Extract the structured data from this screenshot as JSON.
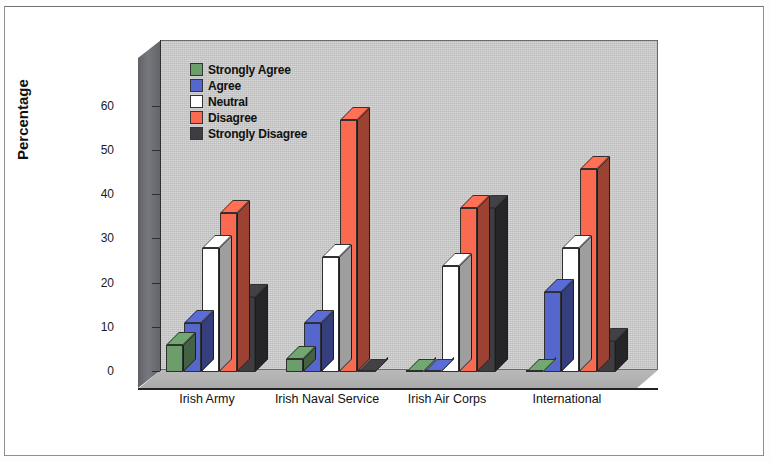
{
  "figure": {
    "axis_title": "Percentage",
    "border_color": "#8d8f92",
    "plot_bg": "#c9c9c9"
  },
  "legend": {
    "items": [
      {
        "label": "Strongly Agree",
        "color": "#6b9e6b"
      },
      {
        "label": "Agree",
        "color": "#5566cc"
      },
      {
        "label": "Neutral",
        "color": "#ffffff"
      },
      {
        "label": "Disagree",
        "color": "#fa6a50"
      },
      {
        "label": "Strongly Disagree",
        "color": "#3d3d42"
      }
    ]
  },
  "chart_data": {
    "type": "bar",
    "title": "",
    "xlabel": "",
    "ylabel": "Percentage",
    "ylim": [
      0,
      65
    ],
    "yticks": [
      0,
      10,
      20,
      30,
      40,
      50,
      60
    ],
    "grid": false,
    "legend_position": "upper-left-inside",
    "categories": [
      "Irish Army",
      "Irish Naval Service",
      "Irish Air Corps",
      "International"
    ],
    "series": [
      {
        "name": "Strongly Agree",
        "color": "#6b9e6b",
        "values": [
          6,
          3,
          0,
          0
        ]
      },
      {
        "name": "Agree",
        "color": "#5566cc",
        "values": [
          11,
          11,
          0,
          18
        ]
      },
      {
        "name": "Neutral",
        "color": "#ffffff",
        "values": [
          28,
          26,
          24,
          28
        ]
      },
      {
        "name": "Disagree",
        "color": "#fa6a50",
        "values": [
          36,
          57,
          37,
          46
        ]
      },
      {
        "name": "Strongly Disagree",
        "color": "#3d3d42",
        "values": [
          17,
          0,
          37,
          7
        ]
      }
    ]
  }
}
